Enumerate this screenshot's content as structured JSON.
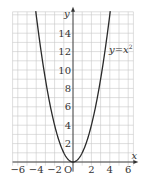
{
  "chart_data": {
    "type": "line",
    "title": "",
    "function": "y = x^2",
    "series": [
      {
        "name": "y=x²",
        "x": [
          -4,
          -3.5,
          -3,
          -2.5,
          -2,
          -1.5,
          -1,
          -0.5,
          0,
          0.5,
          1,
          1.5,
          2,
          2.5,
          3,
          3.5,
          4
        ],
        "y": [
          16,
          12.25,
          9,
          6.25,
          4,
          2.25,
          1,
          0.25,
          0,
          0.25,
          1,
          2.25,
          4,
          6.25,
          9,
          12.25,
          16
        ]
      }
    ],
    "annotation": "y=x²",
    "xlabel": "x",
    "ylabel": "y",
    "origin_label": "O",
    "xlim": [
      -7,
      7
    ],
    "ylim": [
      -0.5,
      16.5
    ],
    "x_ticks": [
      -6,
      -4,
      -2,
      2,
      4,
      6
    ],
    "x_tick_labels": [
      "−6",
      "−4",
      "−2",
      "2",
      "4",
      "6"
    ],
    "y_ticks": [
      2,
      4,
      6,
      8,
      10,
      12,
      14
    ],
    "y_tick_labels": [
      "2",
      "4",
      "6",
      "8",
      "10",
      "12",
      "14"
    ],
    "grid": true,
    "grid_step": 1
  }
}
